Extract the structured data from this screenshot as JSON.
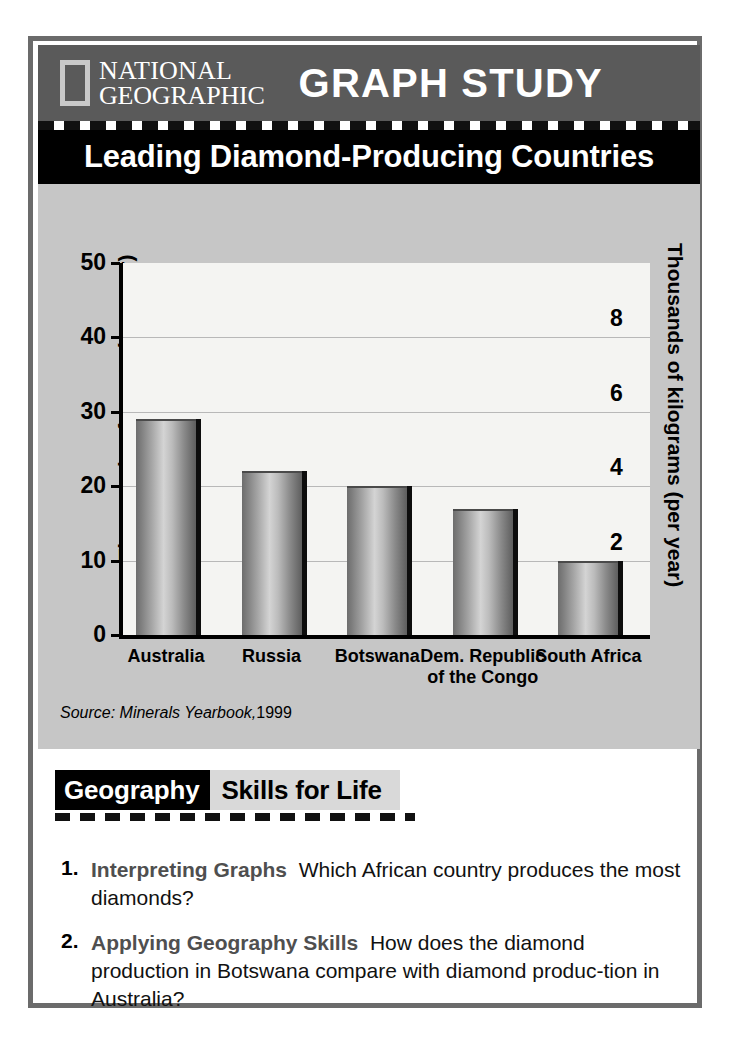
{
  "header": {
    "logo_line1": "NATIONAL",
    "logo_line2": "GEOGRAPHIC",
    "title": "GRAPH STUDY"
  },
  "chart_title": "Leading Diamond-Producing Countries",
  "source_note": {
    "prefix": "Source: Minerals Yearbook,",
    "year": "1999"
  },
  "skills": {
    "label_black": "Geography",
    "label_gray": "Skills for Life"
  },
  "questions": [
    {
      "number": "1.",
      "lead": "Interpreting Graphs",
      "text": "Which African country produces the most diamonds?"
    },
    {
      "number": "2.",
      "lead": "Applying Geography Skills",
      "text": "How does the diamond production in Botswana compare with diamond produc-tion in Australia?"
    }
  ],
  "colors": {
    "header_bg": "#5a5a5a",
    "title_band_bg": "#000000",
    "chart_panel_bg": "#c6c6c6",
    "plot_bg": "#f4f4f2",
    "frame_border": "#6b6b6b",
    "gridline": "#b8b8b8",
    "bar_dark": "#6d6d6d",
    "bar_light": "#d4d4d4",
    "skills_gray_bg": "#d9d9d9",
    "question_lead": "#4f4f4f"
  },
  "chart_data": {
    "type": "bar",
    "title": "Leading Diamond-Producing Countries",
    "categories": [
      "Australia",
      "Russia",
      "Botswana",
      "Dem. Republic of the Congo",
      "South Africa"
    ],
    "values": [
      29,
      22,
      20,
      17,
      10
    ],
    "xlabel": "",
    "ylabel": "Thousands of carats (per year)",
    "y2label": "Thousands of kilograms (per year)",
    "ylim": [
      0,
      50
    ],
    "yticks": [
      0,
      10,
      20,
      30,
      40,
      50
    ],
    "y2lim": [
      0,
      10
    ],
    "y2ticks": [
      2,
      4,
      6,
      8
    ],
    "gridlines_at": [
      10,
      20,
      30,
      40
    ],
    "grid": true,
    "legend": "none",
    "units_left": "thousands of carats per year",
    "units_right": "thousands of kilograms per year"
  }
}
